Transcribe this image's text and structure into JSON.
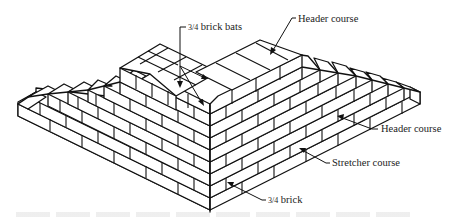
{
  "figure": {
    "labels": {
      "brick_bats": "¾ brick bats",
      "header_course_top": "Header course",
      "header_course_right": "Header course",
      "stretcher_course": "Stretcher course",
      "three_quarter_brick": "¾ brick"
    },
    "label_parts": {
      "brick_bats_fraction": "3/4",
      "brick_bats_text": " brick bats",
      "three_quarter_fraction": "3/4",
      "three_quarter_text": " brick"
    },
    "colors": {
      "line": "#111111",
      "text": "#222222",
      "background": "#ffffff"
    }
  }
}
